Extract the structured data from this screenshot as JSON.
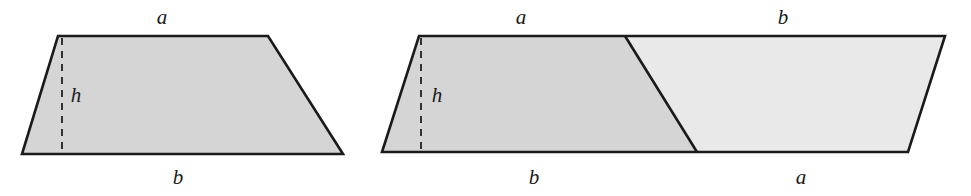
{
  "figure": {
    "type": "geometry-diagram",
    "background_color": "#ffffff",
    "stroke_color": "#1a1a1a",
    "fill_shaded": "#d5d5d5",
    "fill_light": "#e9e9e9",
    "dashed_color": "#333333",
    "panels": [
      {
        "name": "trapezoid",
        "labels": {
          "top": "a",
          "bottom": "b",
          "height": "h"
        },
        "shape_points": "58,36 268,36 343,154 22,154",
        "dash_x": 62,
        "dash_y1": 38,
        "dash_y2": 153,
        "label_positions": {
          "top": {
            "x": 162,
            "y": 24
          },
          "bottom": {
            "x": 178,
            "y": 184
          },
          "height": {
            "x": 76,
            "y": 102
          }
        }
      },
      {
        "name": "parallelogram",
        "labels": {
          "top_left": "a",
          "top_right": "b",
          "bottom_left": "b",
          "bottom_right": "a",
          "height": "h"
        },
        "outer_points": "419,36 945,36 908,152 382,152",
        "shaded_points": "419,36 625,36 697,152 382,152",
        "light_points": "625,36 945,36 908,152 697,152",
        "divider": {
          "x1": 625,
          "y1": 36,
          "x2": 697,
          "y2": 152
        },
        "dash_x": 421,
        "dash_y1": 38,
        "dash_y2": 151,
        "label_positions": {
          "top_left": {
            "x": 521,
            "y": 24
          },
          "top_right": {
            "x": 783,
            "y": 24
          },
          "bottom_left": {
            "x": 534,
            "y": 184
          },
          "bottom_right": {
            "x": 801,
            "y": 184
          },
          "height": {
            "x": 437,
            "y": 102
          }
        }
      }
    ]
  }
}
